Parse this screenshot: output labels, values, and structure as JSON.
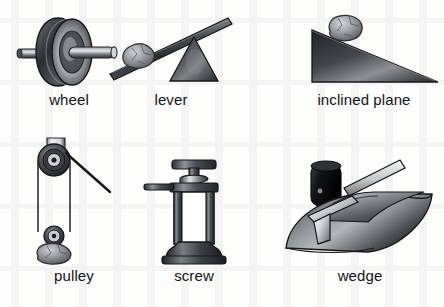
{
  "figure": {
    "background_color": "#fdfdfc",
    "ink_color": "#111418",
    "style": "grayscale line/shaded clip-art, 2 rows x 3 columns"
  },
  "items": [
    {
      "id": "wheel",
      "label": "wheel",
      "icon": "wheel-and-axle-icon",
      "row": 1,
      "column": 1,
      "description": "A shaded disc wheel seen at a three-quarter angle with a cylindrical axle rod passing through its hub and protruding on both sides.",
      "colors": {
        "dark": "#2c2f33",
        "mid": "#6e7277",
        "light": "#e8e9ea"
      }
    },
    {
      "id": "lever",
      "label": "lever",
      "icon": "lever-icon",
      "row": 1,
      "column": 2,
      "description": "A straight bar tilted down to the left, resting on a triangular fulcrum at the right, with a rock load sitting on the low left end.",
      "colors": {
        "dark": "#33373c",
        "mid": "#6a6e73",
        "light": "#b9bcc0"
      }
    },
    {
      "id": "inclined-plane",
      "label": "inclined plane",
      "icon": "inclined-plane-icon",
      "row": 1,
      "column": 3,
      "description": "A dark right-triangle ramp with a vertical left edge sloping down to a thin point at the right, with a rock resting near the top of the slope.",
      "colors": {
        "dark": "#2f3337",
        "mid": "#7b7f84",
        "light": "#c6c9cc"
      }
    },
    {
      "id": "pulley",
      "label": "pulley",
      "icon": "pulley-icon",
      "row": 2,
      "column": 1,
      "description": "A grooved wheel in a hanging bracket at the top with a rope running down around a lower block pulley that carries a rock, and a free rope end pulled off to the right.",
      "colors": {
        "dark": "#26292d",
        "mid": "#6d7175",
        "light": "#e6e7e8"
      }
    },
    {
      "id": "screw",
      "label": "screw",
      "icon": "screw-jack-icon",
      "row": 2,
      "column": 2,
      "description": "A screw jack: a T-shaped cap on a threaded helical shaft rising out of a collared body with a horizontal turning bar on the left and a flared base.",
      "colors": {
        "dark": "#2b2e32",
        "mid": "#73777c",
        "light": "#ffffff"
      }
    },
    {
      "id": "wedge",
      "label": "wedge",
      "icon": "wedge-icon",
      "row": 2,
      "column": 3,
      "description": "A dark mallet with a light handle poised above a rounded log that is being split by a light metal wedge driven into a crack along its top.",
      "colors": {
        "dark": "#1d2023",
        "mid": "#6f7479",
        "light": "#d9dcdf"
      }
    }
  ]
}
